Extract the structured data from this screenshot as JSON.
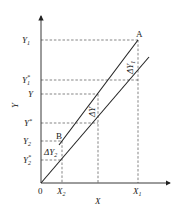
{
  "diagram": {
    "axes": {
      "x_label": "X",
      "y_label": "Y",
      "origin_label": "0"
    },
    "y_ticks": [
      {
        "id": "Y1",
        "base": "Y",
        "sub": "1",
        "sup": ""
      },
      {
        "id": "Y1star",
        "base": "Y",
        "sub": "1",
        "sup": "*"
      },
      {
        "id": "Y",
        "base": "Y",
        "sub": "",
        "sup": ""
      },
      {
        "id": "Ystar",
        "base": "Y",
        "sub": "",
        "sup": "*"
      },
      {
        "id": "Y2",
        "base": "Y",
        "sub": "2",
        "sup": ""
      },
      {
        "id": "Y2star",
        "base": "Y",
        "sub": "2",
        "sup": "*"
      }
    ],
    "x_ticks": [
      {
        "id": "X2",
        "base": "X",
        "sub": "2"
      },
      {
        "id": "X1",
        "base": "X",
        "sub": "1"
      }
    ],
    "points": {
      "A": "A",
      "B": "B"
    },
    "deltas": {
      "dY1": {
        "base": "ΔY",
        "sub": "1"
      },
      "dY": {
        "base": "ΔY",
        "sub": ""
      },
      "dY2": {
        "base": "ΔY",
        "sub": "2"
      }
    },
    "lines": {
      "operating_line": "upper line through B and A",
      "equilibrium_line": "lower line through origin"
    },
    "colors": {
      "ink": "#222222",
      "background": "#ffffff"
    }
  }
}
